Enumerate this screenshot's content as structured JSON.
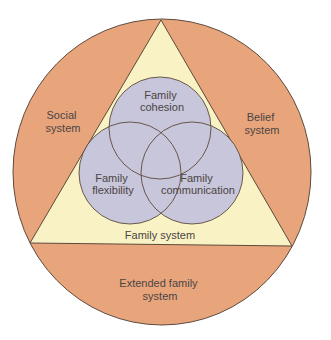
{
  "diagram": {
    "type": "nested-systems-venn",
    "colors": {
      "outer_circle": "#E8A57C",
      "triangle": "#F8F2C4",
      "inner_circles": "#C8C6DA",
      "outline": "#5C4A3C",
      "text": "#4A4444",
      "background": "#FFFFFF"
    },
    "outer_circle": {
      "regions": {
        "left": {
          "line1": "Social",
          "line2": "system"
        },
        "right": {
          "line1": "Belief",
          "line2": "system"
        },
        "bottom": {
          "line1": "Extended family",
          "line2": "system"
        }
      }
    },
    "triangle": {
      "label": "Family system"
    },
    "circles": [
      {
        "id": "cohesion",
        "line1": "Family",
        "line2": "cohesion"
      },
      {
        "id": "flexibility",
        "line1": "Family",
        "line2": "flexibility"
      },
      {
        "id": "communication",
        "line1": "Family",
        "line2": "communication"
      }
    ]
  }
}
